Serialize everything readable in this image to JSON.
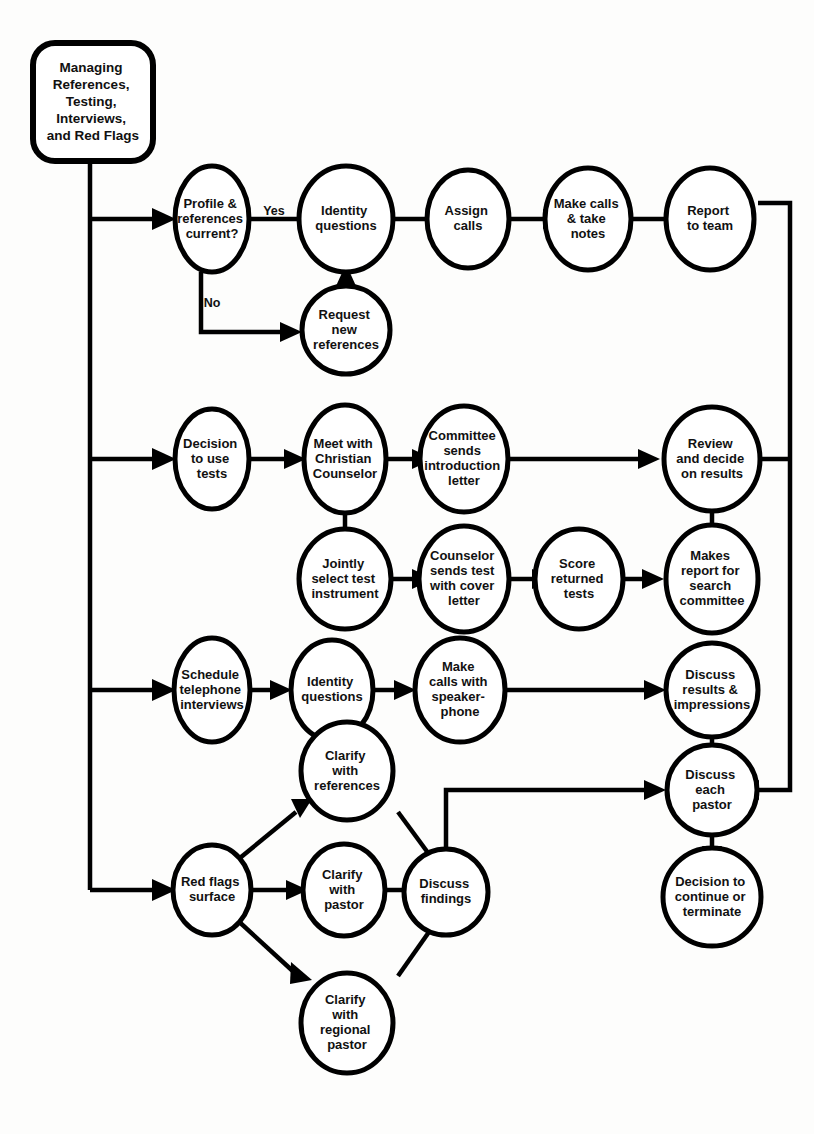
{
  "diagram": {
    "title_node": {
      "id": "start",
      "label_lines": [
        "Managing",
        "References,",
        "Testing,",
        "Interviews,",
        "and Red Flags"
      ],
      "shape": "rounded-rect"
    },
    "branches": [
      {
        "name": "references-branch",
        "nodes": [
          {
            "id": "profile-references-current",
            "label_lines": [
              "Profile &",
              "references",
              "current?"
            ]
          },
          {
            "id": "identity-questions-1",
            "label_lines": [
              "Identity",
              "questions"
            ]
          },
          {
            "id": "assign-calls",
            "label_lines": [
              "Assign",
              "calls"
            ]
          },
          {
            "id": "make-calls-take-notes",
            "label_lines": [
              "Make calls",
              "& take",
              "notes"
            ]
          },
          {
            "id": "report-to-team",
            "label_lines": [
              "Report",
              "to team"
            ]
          },
          {
            "id": "request-new-references",
            "label_lines": [
              "Request",
              "new",
              "references"
            ]
          }
        ],
        "edge_labels": {
          "yes": "Yes",
          "no": "No"
        }
      },
      {
        "name": "testing-branch",
        "nodes": [
          {
            "id": "decision-to-use-tests",
            "label_lines": [
              "Decision",
              "to use",
              "tests"
            ]
          },
          {
            "id": "meet-with-christian-counselor",
            "label_lines": [
              "Meet with",
              "Christian",
              "Counselor"
            ]
          },
          {
            "id": "committee-sends-introduction-letter",
            "label_lines": [
              "Committee",
              "sends",
              "introduction",
              "letter"
            ]
          },
          {
            "id": "review-and-decide-on-results",
            "label_lines": [
              "Review",
              "and decide",
              "on results"
            ]
          },
          {
            "id": "jointly-select-test-instrument",
            "label_lines": [
              "Jointly",
              "select test",
              "instrument"
            ]
          },
          {
            "id": "counselor-sends-test-with-cover-letter",
            "label_lines": [
              "Counselor",
              "sends test",
              "with cover",
              "letter"
            ]
          },
          {
            "id": "score-returned-tests",
            "label_lines": [
              "Score",
              "returned",
              "tests"
            ]
          },
          {
            "id": "makes-report-for-search-committee",
            "label_lines": [
              "Makes",
              "report for",
              "search",
              "committee"
            ]
          }
        ]
      },
      {
        "name": "interviews-branch",
        "nodes": [
          {
            "id": "schedule-telephone-interviews",
            "label_lines": [
              "Schedule",
              "telephone",
              "interviews"
            ]
          },
          {
            "id": "identity-questions-2",
            "label_lines": [
              "Identity",
              "questions"
            ]
          },
          {
            "id": "make-calls-with-speakerphone",
            "label_lines": [
              "Make",
              "calls with",
              "speaker-",
              "phone"
            ]
          },
          {
            "id": "discuss-results-impressions",
            "label_lines": [
              "Discuss",
              "results &",
              "impressions"
            ]
          }
        ]
      },
      {
        "name": "red-flags-branch",
        "nodes": [
          {
            "id": "red-flags-surface",
            "label_lines": [
              "Red flags",
              "surface"
            ]
          },
          {
            "id": "clarify-with-references",
            "label_lines": [
              "Clarify",
              "with",
              "references"
            ]
          },
          {
            "id": "clarify-with-pastor",
            "label_lines": [
              "Clarify",
              "with",
              "pastor"
            ]
          },
          {
            "id": "clarify-with-regional-pastor",
            "label_lines": [
              "Clarify",
              "with",
              "regional",
              "pastor"
            ]
          },
          {
            "id": "discuss-findings",
            "label_lines": [
              "Discuss",
              "findings"
            ]
          }
        ]
      },
      {
        "name": "conclusion-branch",
        "nodes": [
          {
            "id": "discuss-each-pastor",
            "label_lines": [
              "Discuss",
              "each",
              "pastor"
            ]
          },
          {
            "id": "decision-to-continue-or-terminate",
            "label_lines": [
              "Decision to",
              "continue or",
              "terminate"
            ]
          }
        ]
      }
    ],
    "colors": {
      "stroke": "#000000",
      "fill": "#ffffff",
      "background": "#fdfdfc",
      "text": "#111111"
    }
  }
}
